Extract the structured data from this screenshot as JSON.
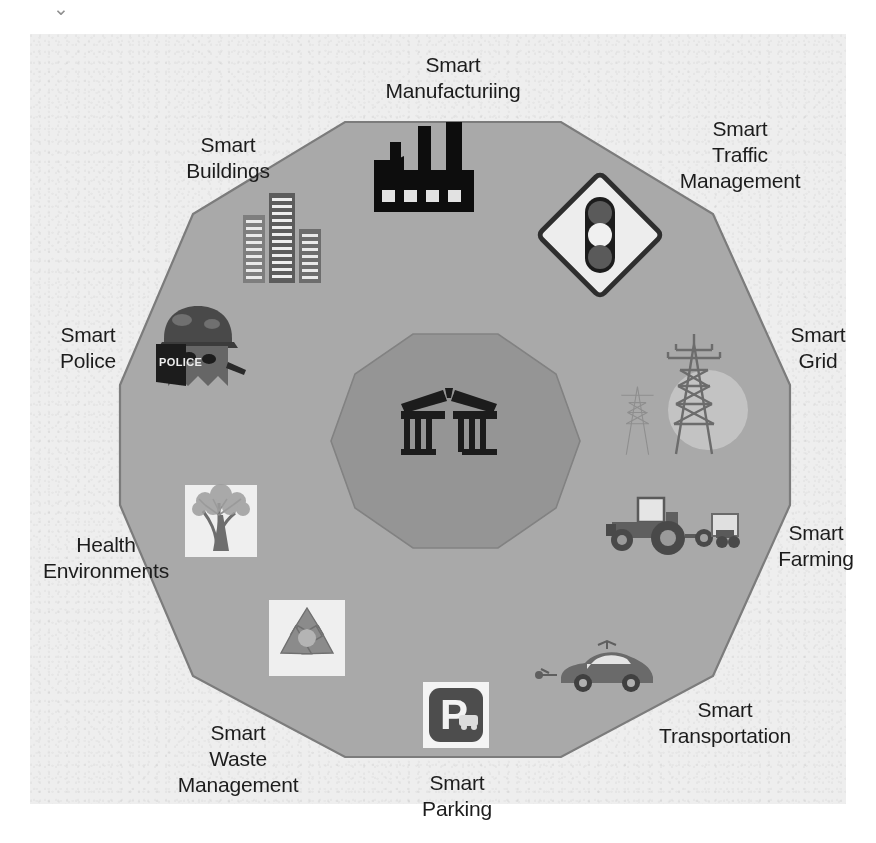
{
  "figure": {
    "type": "concentric-polygon-diagram",
    "shape": "decagon",
    "top_artifact_glyph": "⌄",
    "center": {
      "label": "",
      "icon": "government-building-icon"
    },
    "background_color": "#eeeeee",
    "outer_polygon_color": "#a8a8a8",
    "inner_polygon_color": "#949494",
    "outline_color": "#7a7a7a",
    "text_color": "#1c1c1c"
  },
  "sectors": [
    {
      "id": "smart-manufacturing",
      "label": "Smart\nManufacturiing",
      "icon": "factory-icon",
      "position": "top"
    },
    {
      "id": "smart-traffic-management",
      "label": "Smart\nTraffic\nManagement",
      "icon": "traffic-light-sign-icon",
      "position": "top-right"
    },
    {
      "id": "smart-grid",
      "label": "Smart\nGrid",
      "icon": "power-pylon-icon",
      "position": "right"
    },
    {
      "id": "smart-farming",
      "label": "Smart\nFarming",
      "icon": "tractor-icon",
      "position": "lower-right"
    },
    {
      "id": "smart-transportation",
      "label": "Smart\nTransportation",
      "icon": "connected-car-icon",
      "position": "bottom-right"
    },
    {
      "id": "smart-parking",
      "label": "Smart\nParking",
      "icon": "parking-sign-icon",
      "position": "bottom"
    },
    {
      "id": "smart-waste-management",
      "label": "Smart\nWaste\nManagement",
      "icon": "recycling-icon",
      "position": "bottom-left"
    },
    {
      "id": "health-environments",
      "label": "Health\nEnvironments",
      "icon": "tree-icon",
      "position": "lower-left"
    },
    {
      "id": "smart-police",
      "label": "Smart\nPolice",
      "icon": "police-robot-icon",
      "position": "left"
    },
    {
      "id": "smart-buildings",
      "label": "Smart\nBuildings",
      "icon": "skyscrapers-icon",
      "position": "top-left"
    }
  ],
  "icon_text": {
    "police_shield": "POLICE",
    "parking_letter": "P"
  }
}
